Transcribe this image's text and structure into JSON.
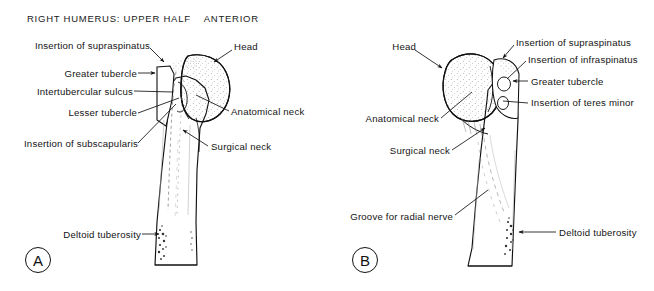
{
  "figure": {
    "type": "anatomical-illustration",
    "panels": [
      {
        "id": "A",
        "letter": "A",
        "title": "RIGHT HUMERUS: UPPER HALF    ANTERIOR",
        "view": "ANTERIOR",
        "labels": [
          {
            "name": "insertion-of-supraspinatus",
            "text": "Insertion of supraspinatus",
            "side": "left",
            "x": 152,
            "y": 45
          },
          {
            "name": "greater-tubercle",
            "text": "Greater tubercle",
            "side": "left",
            "x": 134,
            "y": 73
          },
          {
            "name": "intertubercular-sulcus",
            "text": "Intertubercular sulcus",
            "side": "left",
            "x": 129,
            "y": 91
          },
          {
            "name": "lesser-tubercle",
            "text": "Lesser tubercle",
            "side": "left",
            "x": 134,
            "y": 112
          },
          {
            "name": "insertion-of-subscapularis",
            "text": "Insertion of subscapularis",
            "side": "left",
            "x": 135,
            "y": 142
          },
          {
            "name": "head",
            "text": "Head",
            "side": "right",
            "x": 234,
            "y": 46
          },
          {
            "name": "anatomical-neck",
            "text": "Anatomical neck",
            "side": "right",
            "x": 231,
            "y": 112
          },
          {
            "name": "surgical-neck",
            "text": "Surgical neck",
            "side": "right",
            "x": 211,
            "y": 146
          },
          {
            "name": "deltoid-tuberosity",
            "text": "Deltoid tuberosity",
            "side": "left",
            "x": 138,
            "y": 234
          }
        ]
      },
      {
        "id": "B",
        "letter": "B",
        "title": "RIGHT HUMERUS: UPPER HALF    POSTERIOR",
        "view": "POSTERIOR",
        "labels": [
          {
            "name": "head",
            "text": "Head",
            "side": "left",
            "x": 406,
            "y": 46
          },
          {
            "name": "insertion-of-supraspinatus",
            "text": "Insertion of supraspinatus",
            "side": "right",
            "x": 516,
            "y": 42
          },
          {
            "name": "insertion-of-infraspinatus",
            "text": "Insertion of infraspinatus",
            "side": "right",
            "x": 528,
            "y": 59
          },
          {
            "name": "greater-tubercle",
            "text": "Greater tubercle",
            "side": "right",
            "x": 530,
            "y": 81
          },
          {
            "name": "insertion-of-teres-minor",
            "text": "Insertion of teres minor",
            "side": "right",
            "x": 530,
            "y": 102
          },
          {
            "name": "anatomical-neck",
            "text": "Anatomical neck",
            "side": "left",
            "x": 437,
            "y": 118
          },
          {
            "name": "surgical-neck",
            "text": "Surgical neck",
            "side": "left",
            "x": 448,
            "y": 150
          },
          {
            "name": "groove-for-radial-nerve",
            "text": "Groove for radial nerve",
            "side": "left",
            "x": 451,
            "y": 216
          },
          {
            "name": "deltoid-tuberosity",
            "text": "Deltoid tuberosity",
            "side": "right",
            "x": 558,
            "y": 232
          }
        ]
      }
    ]
  },
  "colors": {
    "background": "#ffffff",
    "ink": "#141414",
    "stipple": "#4a4a4a"
  }
}
